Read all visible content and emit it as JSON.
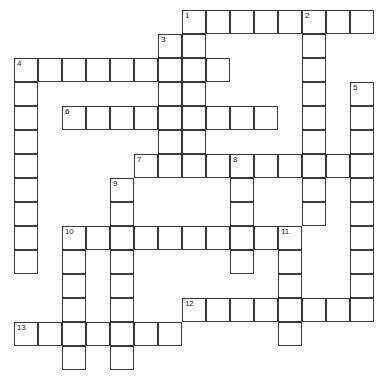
{
  "puzzle": {
    "title": "Crossword Grid",
    "type": "crossword",
    "grid_geometry": {
      "cell_size_px": 24,
      "origin_x_px": 14,
      "origin_y_px": 10,
      "columns": 16,
      "rows": 14,
      "border_color": "#3a3a3a",
      "cell_fill": "#ffffff",
      "page_background": "#ffffff"
    },
    "numbers": [
      {
        "label": "1",
        "col": 7,
        "row": 0
      },
      {
        "label": "2",
        "col": 12,
        "row": 0
      },
      {
        "label": "3",
        "col": 6,
        "row": 1
      },
      {
        "label": "4",
        "col": 0,
        "row": 2
      },
      {
        "label": "5",
        "col": 14,
        "row": 3
      },
      {
        "label": "6",
        "col": 2,
        "row": 4
      },
      {
        "label": "7",
        "col": 5,
        "row": 6
      },
      {
        "label": "8",
        "col": 9,
        "row": 6
      },
      {
        "label": "9",
        "col": 4,
        "row": 7
      },
      {
        "label": "10",
        "col": 2,
        "row": 9
      },
      {
        "label": "11",
        "col": 11,
        "row": 9
      },
      {
        "label": "12",
        "col": 7,
        "row": 12
      },
      {
        "label": "13",
        "col": 0,
        "row": 13
      }
    ],
    "cells": [
      {
        "col": 7,
        "row": 0
      },
      {
        "col": 8,
        "row": 0
      },
      {
        "col": 9,
        "row": 0
      },
      {
        "col": 10,
        "row": 0
      },
      {
        "col": 11,
        "row": 0
      },
      {
        "col": 12,
        "row": 0
      },
      {
        "col": 13,
        "row": 0
      },
      {
        "col": 14,
        "row": 0
      },
      {
        "col": 6,
        "row": 1
      },
      {
        "col": 7,
        "row": 1
      },
      {
        "col": 12,
        "row": 1
      },
      {
        "col": 0,
        "row": 2
      },
      {
        "col": 1,
        "row": 2
      },
      {
        "col": 2,
        "row": 2
      },
      {
        "col": 3,
        "row": 2
      },
      {
        "col": 4,
        "row": 2
      },
      {
        "col": 5,
        "row": 2
      },
      {
        "col": 6,
        "row": 2
      },
      {
        "col": 7,
        "row": 2
      },
      {
        "col": 8,
        "row": 2
      },
      {
        "col": 12,
        "row": 2
      },
      {
        "col": 0,
        "row": 3
      },
      {
        "col": 6,
        "row": 3
      },
      {
        "col": 7,
        "row": 3
      },
      {
        "col": 12,
        "row": 3
      },
      {
        "col": 14,
        "row": 3
      },
      {
        "col": 0,
        "row": 4
      },
      {
        "col": 2,
        "row": 4
      },
      {
        "col": 3,
        "row": 4
      },
      {
        "col": 4,
        "row": 4
      },
      {
        "col": 5,
        "row": 4
      },
      {
        "col": 6,
        "row": 4
      },
      {
        "col": 7,
        "row": 4
      },
      {
        "col": 8,
        "row": 4
      },
      {
        "col": 9,
        "row": 4
      },
      {
        "col": 10,
        "row": 4
      },
      {
        "col": 12,
        "row": 4
      },
      {
        "col": 14,
        "row": 4
      },
      {
        "col": 0,
        "row": 5
      },
      {
        "col": 6,
        "row": 5
      },
      {
        "col": 7,
        "row": 5
      },
      {
        "col": 12,
        "row": 5
      },
      {
        "col": 14,
        "row": 5
      },
      {
        "col": 0,
        "row": 6
      },
      {
        "col": 5,
        "row": 6
      },
      {
        "col": 6,
        "row": 6
      },
      {
        "col": 7,
        "row": 6
      },
      {
        "col": 8,
        "row": 6
      },
      {
        "col": 9,
        "row": 6
      },
      {
        "col": 10,
        "row": 6
      },
      {
        "col": 11,
        "row": 6
      },
      {
        "col": 12,
        "row": 6
      },
      {
        "col": 13,
        "row": 6
      },
      {
        "col": 14,
        "row": 6
      },
      {
        "col": 0,
        "row": 7
      },
      {
        "col": 4,
        "row": 7
      },
      {
        "col": 9,
        "row": 7
      },
      {
        "col": 12,
        "row": 7
      },
      {
        "col": 14,
        "row": 7
      },
      {
        "col": 0,
        "row": 8
      },
      {
        "col": 4,
        "row": 8
      },
      {
        "col": 9,
        "row": 8
      },
      {
        "col": 12,
        "row": 8
      },
      {
        "col": 14,
        "row": 8
      },
      {
        "col": 0,
        "row": 9
      },
      {
        "col": 2,
        "row": 9
      },
      {
        "col": 3,
        "row": 9
      },
      {
        "col": 4,
        "row": 9
      },
      {
        "col": 5,
        "row": 9
      },
      {
        "col": 6,
        "row": 9
      },
      {
        "col": 7,
        "row": 9
      },
      {
        "col": 8,
        "row": 9
      },
      {
        "col": 9,
        "row": 9
      },
      {
        "col": 10,
        "row": 9
      },
      {
        "col": 11,
        "row": 9
      },
      {
        "col": 14,
        "row": 9
      },
      {
        "col": 0,
        "row": 10
      },
      {
        "col": 2,
        "row": 10
      },
      {
        "col": 4,
        "row": 10
      },
      {
        "col": 9,
        "row": 10
      },
      {
        "col": 11,
        "row": 10
      },
      {
        "col": 14,
        "row": 10
      },
      {
        "col": 2,
        "row": 11
      },
      {
        "col": 4,
        "row": 11
      },
      {
        "col": 11,
        "row": 11
      },
      {
        "col": 14,
        "row": 11
      },
      {
        "col": 2,
        "row": 12
      },
      {
        "col": 4,
        "row": 12
      },
      {
        "col": 7,
        "row": 12
      },
      {
        "col": 8,
        "row": 12
      },
      {
        "col": 9,
        "row": 12
      },
      {
        "col": 10,
        "row": 12
      },
      {
        "col": 11,
        "row": 12
      },
      {
        "col": 12,
        "row": 12
      },
      {
        "col": 13,
        "row": 12
      },
      {
        "col": 14,
        "row": 12
      },
      {
        "col": 0,
        "row": 13
      },
      {
        "col": 1,
        "row": 13
      },
      {
        "col": 2,
        "row": 13
      },
      {
        "col": 3,
        "row": 13
      },
      {
        "col": 4,
        "row": 13
      },
      {
        "col": 5,
        "row": 13
      },
      {
        "col": 6,
        "row": 13
      },
      {
        "col": 11,
        "row": 13
      },
      {
        "col": 2,
        "row": 14
      },
      {
        "col": 4,
        "row": 14
      }
    ]
  }
}
